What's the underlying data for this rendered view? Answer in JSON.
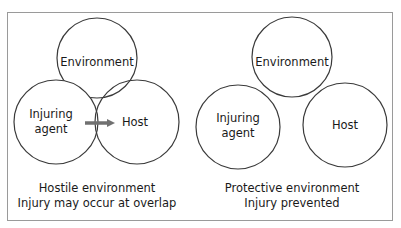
{
  "panels": [
    {
      "id": "hostile",
      "circles": {
        "environment": "Environment",
        "agent_line1": "Injuring",
        "agent_line2": "agent",
        "host": "Host"
      },
      "caption_line1": "Hostile environment",
      "caption_line2": "Injury may occur at overlap",
      "arrow": "agent-to-host"
    },
    {
      "id": "protective",
      "circles": {
        "environment": "Environment",
        "agent_line1": "Injuring",
        "agent_line2": "agent",
        "host": "Host"
      },
      "caption_line1": "Protective environment",
      "caption_line2": "Injury prevented"
    }
  ],
  "colors": {
    "circle_stroke": "#3a3a3a",
    "arrow": "#707070",
    "frame": "#9a9a9a"
  }
}
